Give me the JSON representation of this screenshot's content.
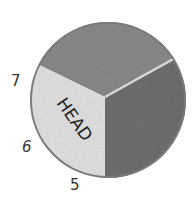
{
  "diagram": {
    "sectors": [
      {
        "label": "HEAD",
        "color": "#e2e2e2"
      },
      {
        "label": "",
        "color": "#8a8a8a"
      },
      {
        "label": "",
        "color": "#6f6f6f"
      }
    ],
    "outline_color": "#7a7a7a",
    "divider_color": "#d8d8d8",
    "numbers": [
      {
        "value": "7"
      },
      {
        "value": "6"
      },
      {
        "value": "5"
      }
    ]
  }
}
